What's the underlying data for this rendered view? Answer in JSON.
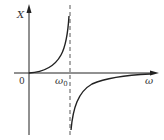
{
  "diagram": {
    "y_axis_label": "X",
    "x_axis_label": "ω",
    "origin_label": "0",
    "resonance_label": "ω",
    "resonance_subscript": "0",
    "colors": {
      "stroke": "#222222",
      "background": "#ffffff",
      "dashed": "#444444"
    }
  }
}
